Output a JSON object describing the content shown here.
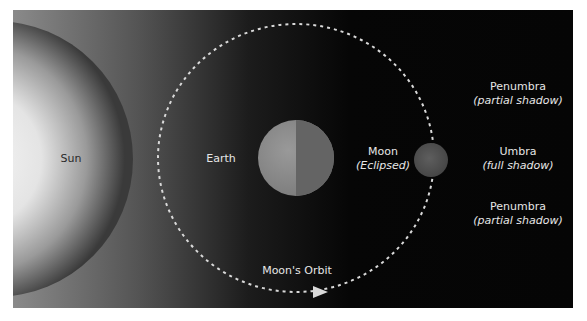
{
  "diagram": {
    "labels": {
      "sun": "Sun",
      "earth": "Earth",
      "moon": "Moon",
      "moon_note": "(Eclipsed)",
      "penumbra_top": "Penumbra",
      "penumbra_top_note": "(partial shadow)",
      "umbra": "Umbra",
      "umbra_note": "(full shadow)",
      "penumbra_bottom": "Penumbra",
      "penumbra_bottom_note": "(partial shadow)",
      "orbit": "Moon's Orbit"
    },
    "colors": {
      "background": "#060606",
      "sun_center": "#f4f4f4",
      "sun_edge": "#3a3a3a",
      "earth_lit": "#8e8e8e",
      "earth_dark": "#6a6a6a",
      "moon": "#555555",
      "orbit_dash": "#d9d9d9",
      "text": "#e6e6e6"
    }
  }
}
